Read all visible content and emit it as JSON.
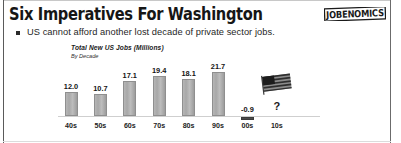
{
  "slide": {
    "title": "Six Imperatives For Washington",
    "bullet": "US cannot afford another lost decade of private sector jobs.",
    "bullet_icon": "square-bullet-icon",
    "logo_text": "JOBENOMICS",
    "logo_icon": "jobenomics-logo"
  },
  "chart_data": {
    "type": "bar",
    "title": "Total New US Jobs (Millions)",
    "subtitle": "By Decade",
    "xlabel": "",
    "ylabel": "",
    "categories": [
      "40s",
      "50s",
      "60s",
      "70s",
      "80s",
      "90s",
      "00s",
      "10s"
    ],
    "values": [
      12.0,
      10.7,
      17.1,
      19.4,
      18.1,
      21.7,
      -0.9,
      null
    ],
    "labels": [
      "12.0",
      "10.7",
      "17.1",
      "19.4",
      "18.1",
      "21.7",
      "-0.9",
      "?"
    ],
    "ylim": [
      -2,
      24
    ],
    "grid": false,
    "legend": null,
    "annotations": [
      {
        "category": "10s",
        "text": "?",
        "type": "question-mark"
      },
      {
        "category": "10s",
        "text": "US flag",
        "type": "us-flag-icon"
      }
    ],
    "colors": {
      "bar_fill": "#b0b0b0",
      "bar_stroke": "#8f8f8f",
      "negative_bar_fill": "#4a4a4a",
      "baseline": "#cfcfcf",
      "label_text": "#141414"
    }
  }
}
